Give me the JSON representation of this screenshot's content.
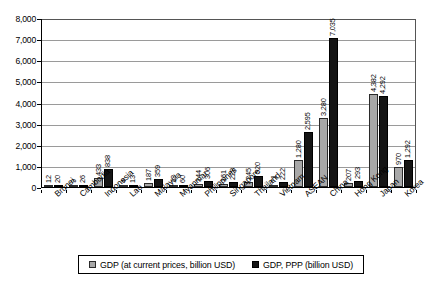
{
  "chart_data": {
    "type": "bar",
    "title": "",
    "subtitle": "",
    "xlabel": "",
    "ylabel": "",
    "ylim": [
      0,
      8000
    ],
    "ytick_step": 1000,
    "ytick_labels": [
      "0",
      "1,000",
      "2,000",
      "3,000",
      "4,000",
      "5,000",
      "6,000",
      "7,000",
      "8,000"
    ],
    "grid": true,
    "legend_position": "bottom",
    "orientation": "vertical",
    "grouping": "grouped",
    "categories": [
      "Brunei",
      "Cambodia",
      "Indonesia",
      "Lao",
      "Malaysia",
      "Myanmar",
      "Philippines",
      "Singapore",
      "Thailand",
      "Vietnam",
      "ASEAN",
      "China",
      "Hong Kong",
      "Japan",
      "Korea"
    ],
    "series": [
      {
        "name": "GDP (at current prices, billion USD)",
        "color": "#a8a8a8",
        "values": [
          12,
          9,
          433,
          4,
          187,
          13,
          144,
          161,
          245,
          71,
          1280,
          3280,
          207,
          4382,
          970
        ],
        "labels": [
          "12",
          "9",
          "433",
          "4",
          "187",
          "13",
          "144",
          "161",
          "245",
          "71",
          "1,280",
          "3,280",
          "207",
          "4,382",
          "970"
        ]
      },
      {
        "name": "GDP, PPP (billion USD)",
        "color": "#151515",
        "values": [
          20,
          26,
          838,
          13,
          359,
          60,
          306,
          228,
          520,
          222,
          2595,
          7035,
          293,
          4292,
          1292
        ],
        "labels": [
          "20",
          "26",
          "838",
          "13",
          "359",
          "60",
          "306",
          "228",
          "520",
          "222",
          "2,595",
          "7,035",
          "293",
          "4,292",
          "1,292"
        ]
      }
    ]
  }
}
